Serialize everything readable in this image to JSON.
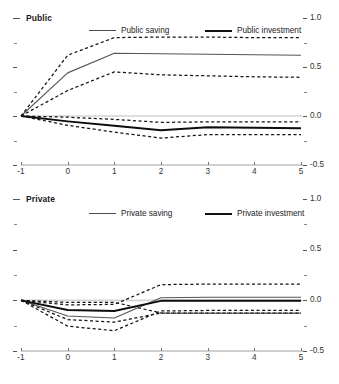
{
  "figure": {
    "panels": [
      {
        "key": "public",
        "title": "Public",
        "legend": [
          {
            "label": "Public saving",
            "style": "thin"
          },
          {
            "label": "Public  investment",
            "style": "thick"
          }
        ]
      },
      {
        "key": "private",
        "title": "Private",
        "legend": [
          {
            "label": "Private saving",
            "style": "thin"
          },
          {
            "label": "Private investment",
            "style": "thick"
          }
        ]
      }
    ],
    "axis": {
      "x_ticks": [
        "-1",
        "0",
        "1",
        "2",
        "3",
        "4",
        "5"
      ],
      "y_ticks": [
        "1.0",
        "0.5",
        "0.0",
        "-0.5"
      ]
    }
  },
  "chart_data": [
    {
      "type": "line",
      "title": "Public",
      "xlabel": "",
      "ylabel": "",
      "x": [
        -1,
        0,
        1,
        2,
        3,
        4,
        5
      ],
      "xlim": [
        -1,
        5
      ],
      "ylim": [
        -0.5,
        1.0
      ],
      "y_ticks": [
        -0.5,
        0.0,
        0.5,
        1.0
      ],
      "grid": false,
      "legend_position": "top",
      "series": [
        {
          "name": "Public saving",
          "style": "solid-thin",
          "values": [
            0.0,
            0.44,
            0.64,
            0.635,
            0.63,
            0.625,
            0.62
          ]
        },
        {
          "name": "Public saving upper band",
          "style": "dashed",
          "values": [
            0.0,
            0.62,
            0.8,
            0.805,
            0.805,
            0.8,
            0.8
          ]
        },
        {
          "name": "Public saving lower band",
          "style": "dashed",
          "values": [
            0.0,
            0.26,
            0.45,
            0.42,
            0.41,
            0.4,
            0.395
          ]
        },
        {
          "name": "Public investment",
          "style": "solid-thick",
          "values": [
            0.0,
            -0.055,
            -0.1,
            -0.145,
            -0.115,
            -0.12,
            -0.125
          ]
        },
        {
          "name": "Public investment upper band",
          "style": "dashed",
          "values": [
            0.0,
            -0.012,
            -0.035,
            -0.065,
            -0.06,
            -0.06,
            -0.06
          ]
        },
        {
          "name": "Public investment lower band",
          "style": "dashed",
          "values": [
            0.0,
            -0.095,
            -0.165,
            -0.225,
            -0.19,
            -0.19,
            -0.19
          ]
        }
      ]
    },
    {
      "type": "line",
      "title": "Private",
      "xlabel": "",
      "ylabel": "",
      "x": [
        -1,
        0,
        1,
        2,
        3,
        4,
        5
      ],
      "xlim": [
        -1,
        5
      ],
      "ylim": [
        -0.5,
        1.0
      ],
      "y_ticks": [
        -0.5,
        0.0,
        0.5,
        1.0
      ],
      "grid": false,
      "legend_position": "top",
      "series": [
        {
          "name": "Private saving",
          "style": "solid-thin",
          "values": [
            0.0,
            -0.155,
            -0.175,
            0.025,
            0.03,
            0.03,
            0.03
          ]
        },
        {
          "name": "Private saving upper band",
          "style": "dashed",
          "values": [
            0.0,
            -0.045,
            -0.04,
            0.155,
            0.16,
            0.16,
            0.16
          ]
        },
        {
          "name": "Private saving lower band",
          "style": "dashed",
          "values": [
            0.0,
            -0.255,
            -0.3,
            -0.105,
            -0.1,
            -0.1,
            -0.1
          ]
        },
        {
          "name": "Private investment",
          "style": "solid-thick",
          "values": [
            0.0,
            -0.095,
            -0.105,
            -0.005,
            -0.005,
            -0.005,
            -0.005
          ]
        },
        {
          "name": "Private investment upper band",
          "style": "dashed",
          "values": [
            0.0,
            -0.02,
            -0.02,
            -0.125,
            -0.125,
            -0.125,
            -0.125
          ]
        },
        {
          "name": "Private investment lower band",
          "style": "dashed",
          "values": [
            0.0,
            -0.19,
            -0.215,
            -0.125,
            -0.125,
            -0.125,
            -0.125
          ]
        }
      ]
    }
  ]
}
